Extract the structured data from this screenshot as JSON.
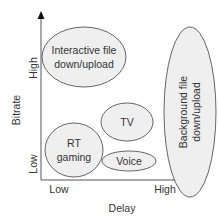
{
  "diagram": {
    "x_axis": {
      "title": "Delay",
      "low_label": "Low",
      "high_label": "High"
    },
    "y_axis": {
      "title": "Bitrate",
      "low_label": "Low",
      "high_label": "High"
    },
    "regions": [
      {
        "id": "interactive",
        "line1": "Interactive file",
        "line2": "down/upload"
      },
      {
        "id": "tv",
        "line1": "TV"
      },
      {
        "id": "rt-gaming",
        "line1": "RT",
        "line2": "gaming"
      },
      {
        "id": "voice",
        "line1": "Voice"
      },
      {
        "id": "background",
        "line1": "Background file",
        "line2": "down/upload"
      }
    ],
    "colors": {
      "ellipse_fill": "#efefef",
      "ellipse_stroke": "#555555",
      "axis": "#444444",
      "text": "#333333"
    }
  }
}
